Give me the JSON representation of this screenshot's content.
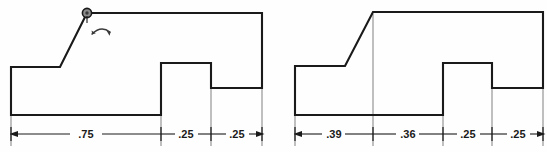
{
  "sheet": {
    "title": "Two-step profile part — before and after bend",
    "background_color": "#fefefe",
    "line_color": "#1a1a1a",
    "dimension_color": "#1a1a1a"
  },
  "figures": [
    {
      "id": "left-figure",
      "name": "profile-before-bend",
      "has_pivot_marker": true,
      "pivot_marker": {
        "name": "pivot-circle-marker",
        "cx": 87,
        "cy": 13
      },
      "rotation_symbol": {
        "name": "rotation-arc-arrow",
        "label": ""
      },
      "outline_points": "11,67 60,67 87,13 262,13 262,88 211,88 211,63 161,63 161,115 11,115",
      "slope_segment": {
        "x1": 60,
        "y1": 67,
        "x2": 87,
        "y2": 13
      },
      "top_flange": {
        "x1": 87,
        "y1": 13,
        "x2": 262,
        "y2": 13
      },
      "dimension_line": {
        "name": "dimension-line-left",
        "y": 134,
        "x_start": 11,
        "x_end": 262,
        "ticks": [
          11,
          161,
          211,
          262
        ],
        "segments": [
          {
            "label": ".75",
            "x1": 11,
            "x2": 161
          },
          {
            "label": ".25",
            "x1": 161,
            "x2": 211
          },
          {
            "label": ".25",
            "x1": 211,
            "x2": 262
          }
        ]
      },
      "extension_lines": [
        {
          "x": 11,
          "y1": 115,
          "y2": 144
        },
        {
          "x": 161,
          "y1": 115,
          "y2": 144
        },
        {
          "x": 211,
          "y1": 88,
          "y2": 144
        },
        {
          "x": 262,
          "y1": 88,
          "y2": 144
        }
      ]
    },
    {
      "id": "right-figure",
      "name": "profile-after-bend",
      "has_pivot_marker": false,
      "pivot_marker": null,
      "rotation_symbol": null,
      "outline_points": "295,66 373,66 373,12 543,12 543,88 492,88 492,63 443,63 443,115 295,115",
      "slope_segment": {
        "x1": 345,
        "y1": 66,
        "x2": 373,
        "y2": 12
      },
      "top_flange": {
        "x1": 373,
        "y1": 12,
        "x2": 543,
        "y2": 12
      },
      "dimension_line": {
        "name": "dimension-line-right",
        "y": 134,
        "x_start": 295,
        "x_end": 543,
        "ticks": [
          295,
          373,
          443,
          492,
          543
        ],
        "segments": [
          {
            "label": ".39",
            "x1": 295,
            "x2": 373
          },
          {
            "label": ".36",
            "x1": 373,
            "x2": 443
          },
          {
            "label": ".25",
            "x1": 443,
            "x2": 492
          },
          {
            "label": ".25",
            "x1": 492,
            "x2": 543
          }
        ]
      },
      "extension_lines": [
        {
          "x": 295,
          "y1": 115,
          "y2": 144
        },
        {
          "x": 373,
          "y1": 12,
          "y2": 144
        },
        {
          "x": 443,
          "y1": 115,
          "y2": 144
        },
        {
          "x": 492,
          "y1": 88,
          "y2": 144
        },
        {
          "x": 543,
          "y1": 88,
          "y2": 144
        }
      ]
    }
  ],
  "dimension_labels": {
    "left": [
      ".75",
      ".25",
      ".25"
    ],
    "right": [
      ".39",
      ".36",
      ".25",
      ".25"
    ]
  }
}
